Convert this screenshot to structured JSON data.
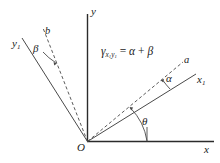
{
  "figure": {
    "title_equation": "γ",
    "background_color": "#ffffff",
    "line_color": "#2b2b2b",
    "text_color": "#1a1a1a"
  },
  "axes": {
    "y_label": "y",
    "x_label": "x",
    "origin_label": "O"
  },
  "lines": {
    "rotated_x_axis_label": "x",
    "rotated_x_axis_sub": "1",
    "rotated_y_axis_label": "y",
    "rotated_y_axis_sub": "1",
    "dashed_a_label": "a",
    "dashed_b_label": "b"
  },
  "angles": {
    "alpha": "α",
    "beta": "β",
    "theta": "θ"
  },
  "equation": {
    "gamma": "γ",
    "subscript": "x₁y₁",
    "sub_x": "x",
    "sub_x_num": "1",
    "sub_y": "y",
    "sub_y_num": "1",
    "equals": "=",
    "alpha": "α",
    "plus": "+",
    "beta": "β",
    "full": "γx₁y₁ = α + β"
  }
}
